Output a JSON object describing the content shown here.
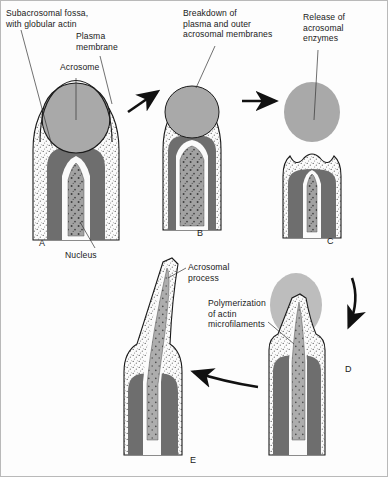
{
  "figure": {
    "background": "#fdfdfd",
    "border_color": "#b9b9b9"
  },
  "palette": {
    "acrosome_gray": "#a9a9a9",
    "nucleus_gray": "#6e6e6e",
    "cytoplasm_white": "#fbfbfb",
    "stipple_dot": "#5a5a5a",
    "outline": "#1a1a1a",
    "fossa_gray": "#9a9a9a",
    "arrow_black": "#111111"
  },
  "labels": [
    {
      "id": "subacrosomal-fossa",
      "text": "Subacrosomal fossa,\nwith globular actin",
      "x": 6,
      "y": 8
    },
    {
      "id": "plasma-membrane",
      "text": "Plasma\nmembrane",
      "x": 76,
      "y": 31
    },
    {
      "id": "acrosome",
      "text": "Acrosome",
      "x": 60,
      "y": 62
    },
    {
      "id": "breakdown-membranes",
      "text": "Breakdown of\nplasma and outer\nacrosomal membranes",
      "x": 183,
      "y": 8
    },
    {
      "id": "release-enzymes",
      "text": "Release of\nacrosomal\nenzymes",
      "x": 303,
      "y": 12
    },
    {
      "id": "nucleus",
      "text": "Nucleus",
      "x": 65,
      "y": 250
    },
    {
      "id": "acrosomal-process",
      "text": "Acrosomal\nprocess",
      "x": 188,
      "y": 262
    },
    {
      "id": "polymerization-actin",
      "text": "Polymerization\nof actin\nmicrofilaments",
      "x": 208,
      "y": 298
    }
  ],
  "panels": [
    {
      "id": "A",
      "letter": "A",
      "letter_x": 39,
      "letter_y": 238,
      "caption": "Intact acrosome over nucleus"
    },
    {
      "id": "B",
      "letter": "B",
      "letter_x": 197,
      "letter_y": 228,
      "caption": "Membranes breaking down"
    },
    {
      "id": "C",
      "letter": "C",
      "letter_x": 327,
      "letter_y": 236,
      "caption": "Acrosomal enzymes released"
    },
    {
      "id": "D",
      "letter": "D",
      "letter_x": 345,
      "letter_y": 364,
      "caption": "Acrosomal process forming"
    },
    {
      "id": "E",
      "letter": "E",
      "letter_x": 190,
      "letter_y": 455,
      "caption": "Acrosomal process extended"
    }
  ],
  "arrows": [
    {
      "id": "arrow-a-to-b",
      "kind": "straight-up-right"
    },
    {
      "id": "arrow-b-to-c",
      "kind": "straight-right"
    },
    {
      "id": "arrow-c-to-d",
      "kind": "curved-down"
    },
    {
      "id": "arrow-d-to-e",
      "kind": "curved-left"
    }
  ]
}
